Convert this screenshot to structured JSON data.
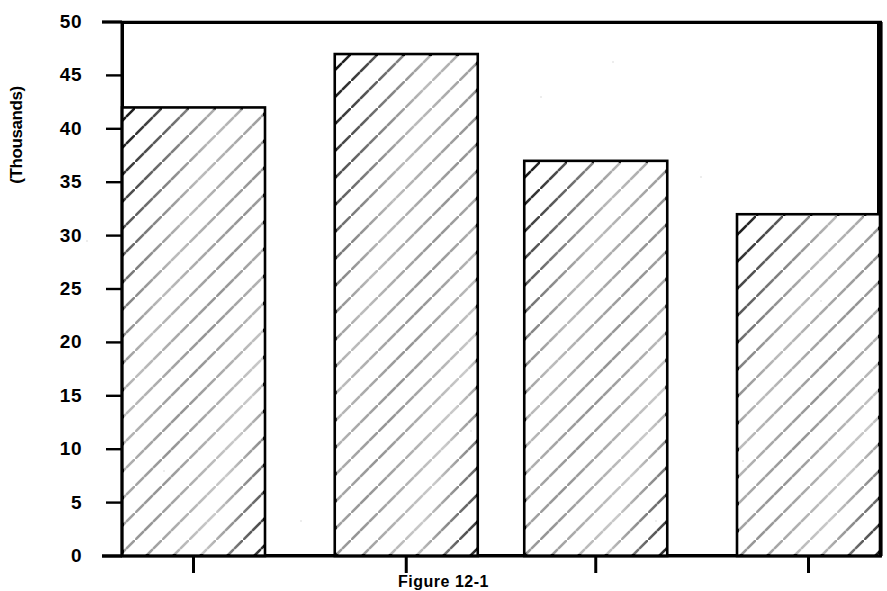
{
  "chart_data": {
    "type": "bar",
    "title": "",
    "subtitle": "",
    "xlabel": "",
    "ylabel": "(Thousands)",
    "categories": [
      "1",
      "2",
      "3",
      "4"
    ],
    "values": [
      42,
      47,
      37,
      32
    ],
    "ylim": [
      0,
      50
    ],
    "yticks": [
      0,
      5,
      10,
      15,
      20,
      25,
      30,
      35,
      40,
      45,
      50
    ],
    "ytick_labels": [
      "0",
      "5",
      "10",
      "15",
      "20",
      "25",
      "30",
      "35",
      "40",
      "45",
      "50"
    ],
    "xtick_labels": [
      "",
      "",
      "",
      ""
    ],
    "grid": false,
    "legend": null,
    "bar_fill": "hatch-diagonal",
    "bar_edge_color": "#000000",
    "background_color": "#ffffff",
    "axis_color": "#000000",
    "annotations": []
  },
  "figure": {
    "caption": "Figure 12-1",
    "caption_visible": "partially cut off at bottom edge"
  },
  "axes": {
    "y": {
      "label": "(Thousands)",
      "ticks": [
        "50",
        "45",
        "40",
        "35",
        "30",
        "25",
        "20",
        "15",
        "10",
        "5",
        "0"
      ]
    },
    "x": {
      "label": "",
      "tick_count": 4
    }
  },
  "colors": {
    "ink": "#000000",
    "paper": "#ffffff",
    "hatch": "#1a1a1a",
    "faded_hatch": "#9a9a9a"
  }
}
